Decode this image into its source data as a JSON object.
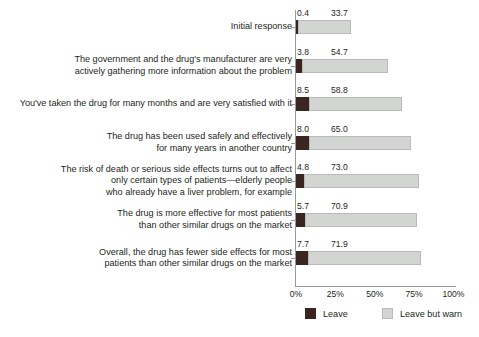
{
  "chart_data": {
    "type": "bar",
    "orientation": "horizontal",
    "stacked": true,
    "title": "",
    "subtitle": "",
    "xlabel": "",
    "ylabel": "",
    "xlim": [
      0,
      100
    ],
    "xticks": [
      "0%",
      "25%",
      "50%",
      "75%",
      "100%"
    ],
    "xtick_values": [
      0,
      25,
      50,
      75,
      100
    ],
    "grid": false,
    "legend_position": "bottom",
    "categories": [
      "Initial response",
      "The government and the drug's manufacturer are very actively gathering more information about the problem",
      "You've taken the drug for many months and are very satisfied with it",
      "The drug has been used safely and effectively for many years in another country",
      "The risk of death or serious side effects turns out to affect only certain types of patients—elderly people who already have a liver problem, for example",
      "The drug is more effective for most patients than other similar drugs on the market",
      "Overall, the drug has fewer side effects for most patients than other similar drugs on the market"
    ],
    "category_lines": [
      [
        "Initial response"
      ],
      [
        "The government and the drug's manufacturer are very",
        "actively gathering more information about the problem"
      ],
      [
        "You've taken the drug for many months and are very satisfied with it"
      ],
      [
        "The drug has been used safely and effectively",
        "for many years in another country"
      ],
      [
        "The risk of death or serious side effects turns out to affect",
        "only certain types of patients—elderly people",
        "who already have a liver problem, for example"
      ],
      [
        "The drug is more effective for most patients",
        "than other similar drugs on the market"
      ],
      [
        "Overall, the drug has fewer side effects for most",
        "patients than other similar drugs on the market"
      ]
    ],
    "series": [
      {
        "name": "Leave",
        "color": "#3a2521",
        "values": [
          0.4,
          3.8,
          8.5,
          8.0,
          4.8,
          5.7,
          7.7
        ],
        "labels": [
          "0.4",
          "3.8",
          "8.5",
          "8.0",
          "4.8",
          "5.7",
          "7.7"
        ]
      },
      {
        "name": "Leave but warn",
        "color": "#d3d5d3",
        "values": [
          33.7,
          54.7,
          58.8,
          65.0,
          73.0,
          70.9,
          71.9
        ],
        "labels": [
          "33.7",
          "54.7",
          "58.8",
          "65.0",
          "73.0",
          "70.9",
          "71.9"
        ]
      }
    ],
    "legend": [
      {
        "label": "Leave",
        "color": "#3a2521"
      },
      {
        "label": "Leave but warn",
        "color": "#d3d5d3"
      }
    ]
  }
}
